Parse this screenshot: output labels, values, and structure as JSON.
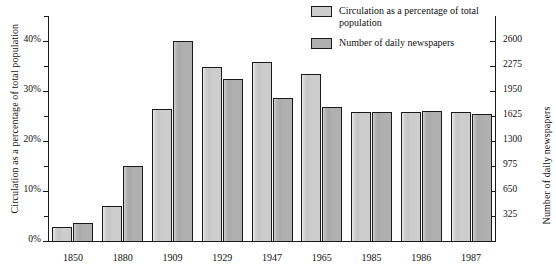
{
  "chart_data": {
    "type": "bar",
    "title": "",
    "categories": [
      "1850",
      "1880",
      "1909",
      "1929",
      "1947",
      "1965",
      "1985",
      "1986",
      "1987"
    ],
    "series": [
      {
        "name": "Circulation as a percentage of total population",
        "axis": "left",
        "unit": "%",
        "color": "#cdcdcd",
        "values": [
          2.9,
          7.0,
          26.5,
          34.8,
          35.8,
          33.5,
          25.9,
          25.8,
          25.8
        ]
      },
      {
        "name": "Number of daily newspapers",
        "axis": "right",
        "unit": "newspapers",
        "color": "#b0b0b0",
        "values": [
          240,
          975,
          2600,
          2100,
          1860,
          1740,
          1680,
          1690,
          1650
        ]
      }
    ],
    "left_axis": {
      "label": "Circulation as a percentage of total population",
      "ticks": [
        "0%",
        "10%",
        "20%",
        "30%",
        "40%"
      ],
      "tick_values": [
        0,
        10,
        20,
        30,
        40
      ],
      "minor_tick_values": [
        5,
        15,
        25,
        35,
        45
      ],
      "lim": [
        0,
        45
      ]
    },
    "right_axis": {
      "label": "Number of daily newspapers",
      "ticks": [
        "325",
        "650",
        "975",
        "1300",
        "1625",
        "1950",
        "2275",
        "2600"
      ],
      "tick_values": [
        325,
        650,
        975,
        1300,
        1625,
        1950,
        2275,
        2600
      ],
      "lim": [
        0,
        2925
      ]
    },
    "xlabel": "",
    "grid": false,
    "legend_position": "top-right"
  },
  "legend": {
    "entries": [
      {
        "label": "Circulation as a percentage of total population",
        "swatch": "light"
      },
      {
        "label": "Number of daily newspapers",
        "swatch": "dark"
      }
    ]
  }
}
